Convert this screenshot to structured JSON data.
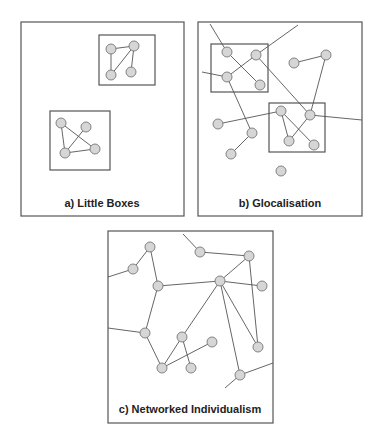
{
  "colors": {
    "frame": "#555555",
    "edge": "#555555",
    "node_fill": "#d6d6d6",
    "node_stroke": "#777777",
    "label": "#222222"
  },
  "panels": [
    {
      "id": "a",
      "title": "a) Little Boxes",
      "frame": {
        "x": 21,
        "y": 22,
        "w": 163,
        "h": 194
      },
      "title_pos": {
        "x": 102,
        "y": 207
      },
      "boxes": [
        {
          "x": 99,
          "y": 35,
          "w": 56,
          "h": 50
        },
        {
          "x": 50,
          "y": 111,
          "w": 60,
          "h": 59
        }
      ],
      "nodes": [
        [
          111,
          49
        ],
        [
          134,
          46
        ],
        [
          111,
          75
        ],
        [
          131,
          72
        ],
        [
          61,
          123
        ],
        [
          86,
          127
        ],
        [
          65,
          153
        ],
        [
          95,
          149
        ]
      ],
      "edges": [
        [
          111,
          49,
          134,
          46
        ],
        [
          111,
          49,
          111,
          75
        ],
        [
          134,
          46,
          111,
          75
        ],
        [
          134,
          46,
          131,
          72
        ],
        [
          61,
          123,
          65,
          153
        ],
        [
          61,
          123,
          95,
          149
        ],
        [
          86,
          127,
          65,
          153
        ],
        [
          65,
          153,
          95,
          149
        ]
      ]
    },
    {
      "id": "b",
      "title": "b) Glocalisation",
      "frame": {
        "x": 198,
        "y": 22,
        "w": 164,
        "h": 194
      },
      "title_pos": {
        "x": 280,
        "y": 207
      },
      "boxes": [
        {
          "x": 211,
          "y": 44,
          "w": 57,
          "h": 48
        },
        {
          "x": 269,
          "y": 103,
          "w": 56,
          "h": 49
        }
      ],
      "nodes": [
        [
          227,
          52
        ],
        [
          256,
          55
        ],
        [
          227,
          77
        ],
        [
          260,
          85
        ],
        [
          294,
          63
        ],
        [
          326,
          55
        ],
        [
          281,
          111
        ],
        [
          310,
          115
        ],
        [
          289,
          141
        ],
        [
          314,
          145
        ],
        [
          218,
          124
        ],
        [
          252,
          133
        ],
        [
          231,
          154
        ],
        [
          281,
          171
        ]
      ],
      "edges": [
        [
          210,
          24,
          227,
          52
        ],
        [
          227,
          52,
          260,
          85
        ],
        [
          256,
          55,
          298,
          25
        ],
        [
          256,
          55,
          227,
          77
        ],
        [
          202,
          72,
          227,
          77
        ],
        [
          256,
          55,
          310,
          115
        ],
        [
          227,
          77,
          252,
          133
        ],
        [
          252,
          133,
          231,
          154
        ],
        [
          294,
          63,
          326,
          55
        ],
        [
          326,
          55,
          310,
          115
        ],
        [
          218,
          124,
          281,
          111
        ],
        [
          281,
          111,
          289,
          141
        ],
        [
          281,
          111,
          314,
          145
        ],
        [
          310,
          115,
          289,
          141
        ],
        [
          310,
          115,
          362,
          120
        ]
      ]
    },
    {
      "id": "c",
      "title": "c) Networked Individualism",
      "frame": {
        "x": 108,
        "y": 231,
        "w": 165,
        "h": 192
      },
      "title_pos": {
        "x": 190,
        "y": 413
      },
      "boxes": [],
      "nodes": [
        [
          150,
          247
        ],
        [
          133,
          269
        ],
        [
          158,
          286
        ],
        [
          200,
          252
        ],
        [
          249,
          256
        ],
        [
          220,
          281
        ],
        [
          262,
          286
        ],
        [
          145,
          333
        ],
        [
          182,
          337
        ],
        [
          212,
          342
        ],
        [
          258,
          347
        ],
        [
          162,
          368
        ],
        [
          191,
          368
        ],
        [
          240,
          375
        ]
      ],
      "edges": [
        [
          108,
          277,
          133,
          269
        ],
        [
          133,
          269,
          150,
          247
        ],
        [
          150,
          247,
          158,
          286
        ],
        [
          183,
          234,
          200,
          252
        ],
        [
          200,
          252,
          249,
          256
        ],
        [
          249,
          256,
          220,
          281
        ],
        [
          249,
          256,
          258,
          347
        ],
        [
          158,
          286,
          220,
          281
        ],
        [
          220,
          281,
          262,
          286
        ],
        [
          158,
          286,
          145,
          333
        ],
        [
          108,
          328,
          145,
          333
        ],
        [
          145,
          333,
          162,
          368
        ],
        [
          162,
          368,
          182,
          337
        ],
        [
          182,
          337,
          191,
          368
        ],
        [
          162,
          368,
          212,
          342
        ],
        [
          182,
          337,
          220,
          281
        ],
        [
          220,
          281,
          258,
          347
        ],
        [
          220,
          281,
          240,
          375
        ],
        [
          240,
          375,
          273,
          363
        ],
        [
          240,
          375,
          225,
          388
        ]
      ]
    }
  ],
  "node_radius": 5
}
